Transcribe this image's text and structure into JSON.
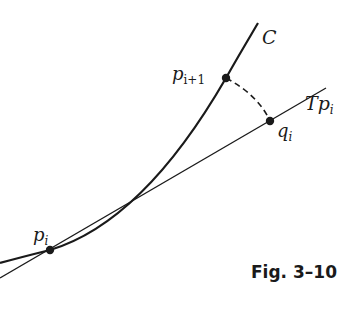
{
  "figure": {
    "caption": "Fig. 3–10",
    "labels": {
      "curve": "C",
      "tangent_prefix": "T",
      "tangent_point": "p",
      "tangent_sub": "i",
      "point_next": "p",
      "point_next_sub": "i+1",
      "point_q": "q",
      "point_q_sub": "i",
      "point_p": "p",
      "point_p_sub": "i"
    },
    "colors": {
      "ink": "#1a1a1a",
      "background": "#ffffff"
    }
  }
}
